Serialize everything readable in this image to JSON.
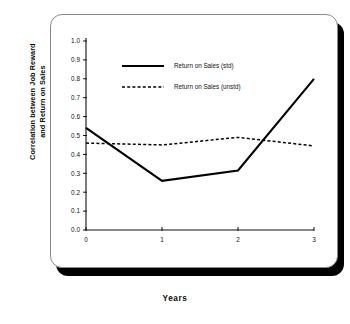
{
  "chart_data": {
    "type": "line",
    "title": "",
    "xlabel": "Years",
    "ylabel": "Correlation between Job Reward and Return on Sales",
    "ylabel_line1": "Correlation between Job Reward",
    "ylabel_line2": "and Return on Sales",
    "x": [
      0,
      1,
      2,
      3
    ],
    "xticklabels": [
      "0",
      "1",
      "2",
      "3"
    ],
    "xlim": [
      0,
      3
    ],
    "ylim": [
      0.0,
      1.0
    ],
    "yticklabels": [
      "0.0",
      "0.1",
      "0.2",
      "0.3",
      "0.4",
      "0.5",
      "0.6",
      "0.7",
      "0.8",
      "0.9",
      "1.0"
    ],
    "ytickvalues": [
      0.0,
      0.1,
      0.2,
      0.3,
      0.4,
      0.5,
      0.6,
      0.7,
      0.8,
      0.9,
      1.0
    ],
    "grid": false,
    "legend_position": "upper-center",
    "series": [
      {
        "name": "Return on Sales (std)",
        "style": "solid",
        "color": "#000000",
        "values": [
          0.54,
          0.26,
          0.315,
          0.8
        ]
      },
      {
        "name": "Return on Sales (unstd)",
        "style": "dashed",
        "color": "#000000",
        "values": [
          0.46,
          0.45,
          0.49,
          0.445
        ]
      }
    ]
  },
  "legend": {
    "items": [
      {
        "label": "Return on Sales (std)",
        "style": "solid"
      },
      {
        "label": "Return on Sales (unstd)",
        "style": "dashed"
      }
    ]
  }
}
